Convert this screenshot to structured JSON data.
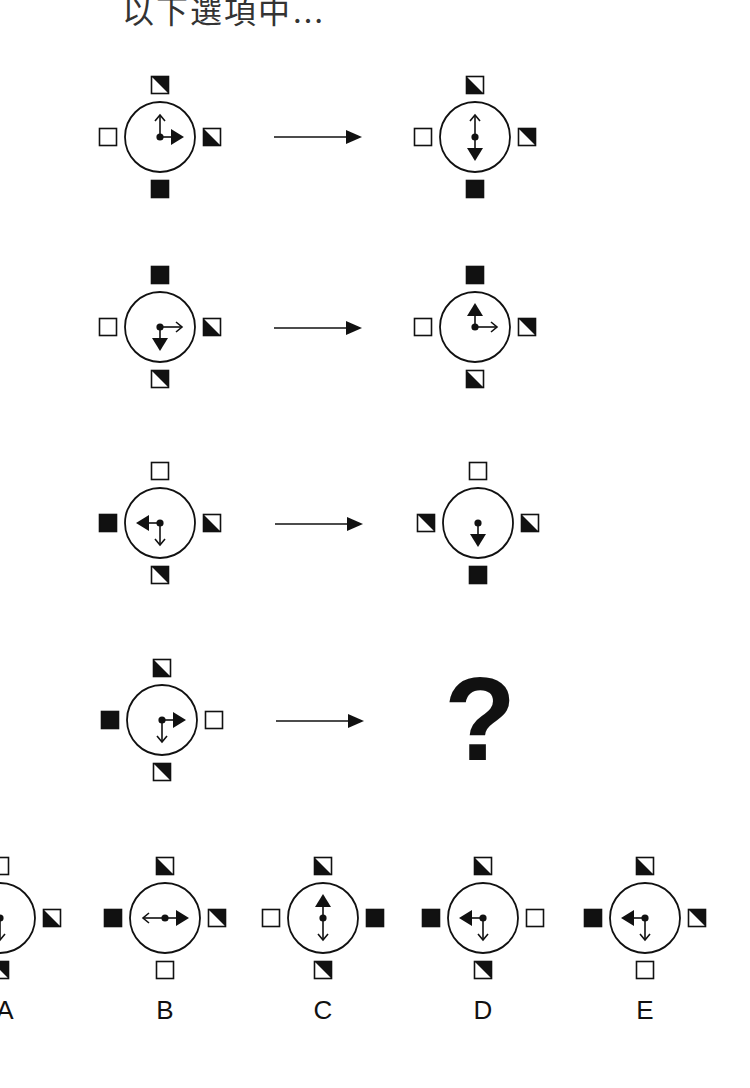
{
  "header": {
    "title": "以下選項中…"
  },
  "legend_note": "square fill codes: white, black, tri_ur (black upper-right triangle), tri_ll (black lower-left triangle)",
  "rows": [
    {
      "left": {
        "squares": {
          "top": "tri_ur",
          "left": "white",
          "right": "tri_ll",
          "bottom": "black"
        },
        "arrows": {
          "filled": "right",
          "open": "up"
        }
      },
      "right": {
        "squares": {
          "top": "tri_ll",
          "left": "white",
          "right": "tri_ur",
          "bottom": "black"
        },
        "arrows": {
          "filled": "down",
          "open": "up"
        }
      }
    },
    {
      "left": {
        "squares": {
          "top": "black",
          "left": "white",
          "right": "tri_ll",
          "bottom": "tri_ur"
        },
        "arrows": {
          "filled": "down",
          "open": "right"
        }
      },
      "right": {
        "squares": {
          "top": "black",
          "left": "white",
          "right": "tri_ur",
          "bottom": "tri_ll"
        },
        "arrows": {
          "filled": "up",
          "open": "right"
        }
      }
    },
    {
      "left": {
        "squares": {
          "top": "white",
          "left": "black",
          "right": "tri_ll",
          "bottom": "tri_ur"
        },
        "arrows": {
          "filled": "left",
          "open": "down"
        }
      },
      "right": {
        "squares": {
          "top": "white",
          "left": "tri_ur",
          "right": "tri_ll",
          "bottom": "black"
        },
        "arrows": {
          "filled": "down",
          "open": null
        }
      }
    },
    {
      "left": {
        "squares": {
          "top": "tri_ll",
          "left": "black",
          "right": "white",
          "bottom": "tri_ur"
        },
        "arrows": {
          "filled": "right",
          "open": "down"
        }
      },
      "right": {
        "question": "?"
      }
    }
  ],
  "options": [
    {
      "label": "A",
      "squares": {
        "top": "white",
        "left": "none",
        "right": "tri_ll",
        "bottom": "tri_ur"
      },
      "arrows": {
        "filled": null,
        "open": "down"
      }
    },
    {
      "label": "B",
      "squares": {
        "top": "tri_ll",
        "left": "black",
        "right": "tri_ur",
        "bottom": "white"
      },
      "arrows": {
        "filled": "right",
        "open": "left"
      }
    },
    {
      "label": "C",
      "squares": {
        "top": "tri_ll",
        "left": "white",
        "right": "black",
        "bottom": "tri_ur"
      },
      "arrows": {
        "filled": "up",
        "open": "down"
      }
    },
    {
      "label": "D",
      "squares": {
        "top": "tri_ll",
        "left": "black",
        "right": "white",
        "bottom": "tri_ur"
      },
      "arrows": {
        "filled": "left",
        "open": "down"
      }
    },
    {
      "label": "E",
      "squares": {
        "top": "tri_ll",
        "left": "black",
        "right": "tri_ur",
        "bottom": "white"
      },
      "arrows": {
        "filled": "left",
        "open": "down"
      }
    }
  ]
}
